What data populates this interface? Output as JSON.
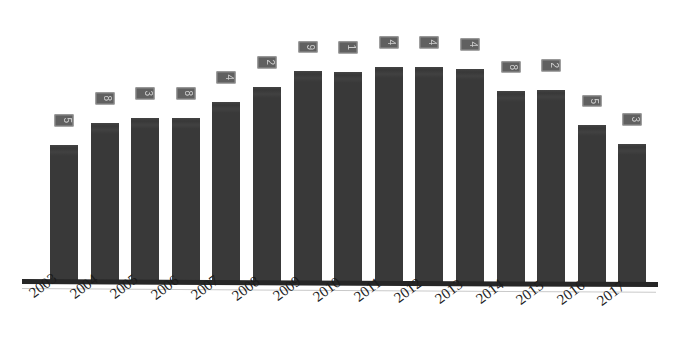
{
  "chart_data": {
    "type": "bar",
    "title": "",
    "subtitle": "",
    "xlabel": "",
    "ylabel": "",
    "categories": [
      "2003",
      "2004",
      "2005",
      "2006",
      "2007",
      "2008",
      "2009",
      "2010",
      "2011",
      "2012",
      "2013",
      "2014",
      "2015",
      "2016",
      "2017"
    ],
    "values": [
      63.7,
      74.0,
      76.3,
      76.3,
      83.7,
      90.7,
      98.1,
      97.7,
      100.0,
      100.0,
      99.1,
      88.8,
      89.3,
      73.0,
      64.2
    ],
    "value_labels": [
      "5",
      "8",
      "3",
      "8",
      "4",
      "2",
      "9",
      "1",
      "4",
      "4",
      "4",
      "8",
      "2",
      "5",
      "3"
    ],
    "series": [
      {
        "name": "Series 1",
        "values": [
          63.7,
          74.0,
          76.3,
          76.3,
          83.7,
          90.7,
          98.1,
          97.7,
          100.0,
          100.0,
          99.1,
          88.8,
          89.3,
          73.0,
          64.2
        ]
      }
    ],
    "ylim": [
      0,
      100
    ],
    "grid": false,
    "legend": "none",
    "bar_color": "#3b3b3b",
    "label_box_color": "#4a4a4a",
    "label_text_color": "#dcdcdc",
    "axis_color": "#262626",
    "background_color": "#ffffff",
    "tick_label_rotation": -37,
    "value_label_rotation": 90
  }
}
